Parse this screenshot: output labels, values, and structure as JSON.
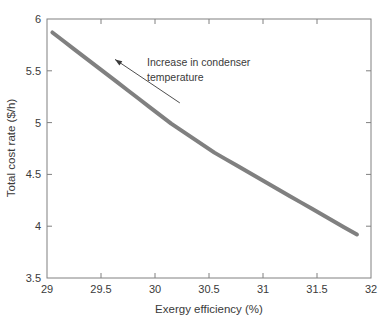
{
  "chart_data": {
    "type": "line",
    "title": "",
    "xlabel": "Exergy efficiency (%)",
    "ylabel": "Total cost rate ($/h)",
    "xlim": [
      29,
      32
    ],
    "ylim": [
      3.5,
      6
    ],
    "xticks": [
      "29",
      "29.5",
      "30",
      "30.5",
      "31",
      "31.5",
      "32"
    ],
    "yticks": [
      "3.5",
      "4",
      "4.5",
      "5",
      "5.5",
      "6"
    ],
    "xtick_values": [
      29,
      29.5,
      30,
      30.5,
      31,
      31.5,
      32
    ],
    "ytick_values": [
      3.5,
      4,
      4.5,
      5,
      5.5,
      6
    ],
    "grid": false,
    "legend": null,
    "series": [
      {
        "name": "Pareto front",
        "color": "#808080",
        "linewidth": 4,
        "x": [
          29.05,
          29.15,
          29.25,
          29.35,
          29.45,
          29.55,
          29.65,
          29.75,
          29.85,
          29.95,
          30.05,
          30.15,
          30.25,
          30.35,
          30.45,
          30.55,
          30.65,
          30.75,
          30.85,
          30.95,
          31.05,
          31.15,
          31.25,
          31.35,
          31.45,
          31.55,
          31.65,
          31.75,
          31.87
        ],
        "y": [
          5.87,
          5.79,
          5.71,
          5.63,
          5.55,
          5.47,
          5.39,
          5.31,
          5.23,
          5.15,
          5.07,
          4.99,
          4.92,
          4.85,
          4.78,
          4.71,
          4.65,
          4.59,
          4.53,
          4.47,
          4.41,
          4.35,
          4.29,
          4.23,
          4.17,
          4.11,
          4.05,
          3.99,
          3.92
        ]
      }
    ],
    "annotations": [
      {
        "name": "increase-in-condenser-temperature",
        "text_line1": "Increase in condenser",
        "text_line2": "temperature",
        "arrow_tip": [
          29.63,
          5.61
        ],
        "arrow_tail": [
          30.23,
          5.19
        ],
        "color": "#3a3a3a"
      }
    ],
    "axis_color": "#808080",
    "text_color": "#3a3a3a",
    "background": "#ffffff"
  }
}
